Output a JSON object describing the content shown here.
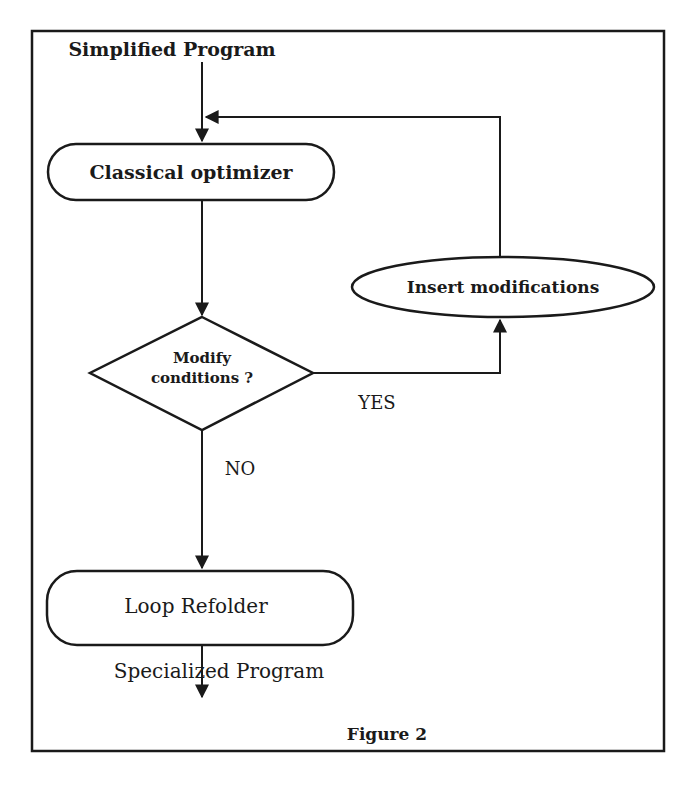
{
  "figure": {
    "caption": "Figure 2",
    "input_label": "Simplified Program",
    "output_label": "Specialized Program",
    "nodes": {
      "classical_optimizer": "Classical optimizer",
      "modify_conditions_line1": "Modify",
      "modify_conditions_line2": "conditions ?",
      "insert_modifications": "Insert modifications",
      "loop_refolder": "Loop Refolder"
    },
    "edges": {
      "yes_label": "YES",
      "no_label": "NO"
    }
  },
  "colors": {
    "ink": "#1a1a1a",
    "background": "#ffffff",
    "bleed_through_text": "#c8c8c8"
  }
}
